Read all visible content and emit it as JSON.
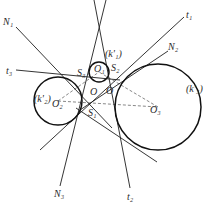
{
  "diagram": {
    "type": "geometry-construction",
    "circles": [
      {
        "id": "k1",
        "label": "(k'₁)",
        "center_label": "O₁",
        "cx": 99,
        "cy": 72,
        "r": 10
      },
      {
        "id": "k2",
        "label": "(k'₂)",
        "center_label": "O₂",
        "cx": 58,
        "cy": 101,
        "r": 24
      },
      {
        "id": "k3",
        "label": "(k'₃)",
        "center_label": "O₃",
        "cx": 158,
        "cy": 107,
        "r": 43
      }
    ],
    "lines": [
      {
        "label": "N₁",
        "x1": 16,
        "y1": 27,
        "x2": 112,
        "y2": 128
      },
      {
        "label": "t₃",
        "x1": 16,
        "y1": 70,
        "x2": 120,
        "y2": 80
      },
      {
        "label": "t₁",
        "x1": 184,
        "y1": 17,
        "x2": 40,
        "y2": 150
      },
      {
        "label": "N₂",
        "x1": 168,
        "y1": 51,
        "x2": 80,
        "y2": 110
      },
      {
        "label": "N₃",
        "x1": 60,
        "y1": 186,
        "x2": 106,
        "y2": 0
      },
      {
        "label": "t₂",
        "x1": 130,
        "y1": 188,
        "x2": 94,
        "y2": 0
      },
      {
        "label": "",
        "x1": 76,
        "y1": 108,
        "x2": 157,
        "y2": 162
      }
    ],
    "labels": {
      "N1": "N₁",
      "N2": "N₂",
      "N3": "N₃",
      "t1": "t₁",
      "t2": "t₂",
      "t3": "t₃",
      "S1": "S₁",
      "S2": "S₂",
      "S3": "S₃",
      "O": "O",
      "O_prime": "O",
      "O1": "O₁",
      "O2": "O₂",
      "O3": "O₃",
      "k1": "(k'₁)",
      "k2": "(k'₂)",
      "k3": "(k'₃)"
    },
    "colors": {
      "stroke": "#1e1e1e",
      "circle": "#111111",
      "dashed": "#555555",
      "text": "#2a2a2a",
      "background": "#ffffff"
    }
  }
}
